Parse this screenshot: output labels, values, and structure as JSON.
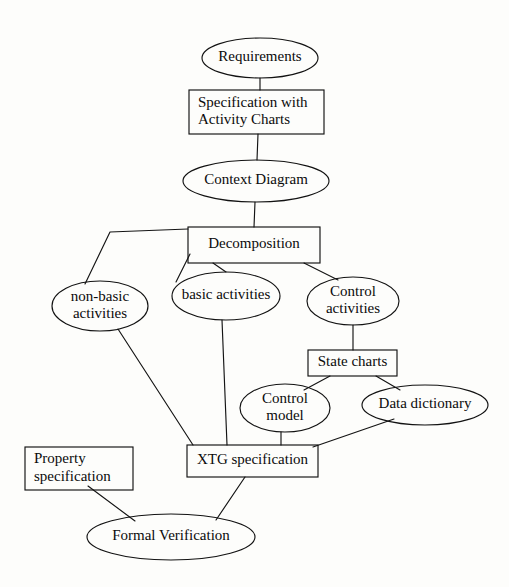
{
  "diagram": {
    "type": "flow-diagram",
    "background_color": "#fdfdfb",
    "line_color": "#141414",
    "text_color": "#0b0b0b",
    "nodes": [
      {
        "id": "requirements",
        "label": "Requirements",
        "shape": "ellipse",
        "lines": [
          "Requirements"
        ],
        "cx": 260,
        "cy": 58,
        "rx": 58,
        "ry": 20
      },
      {
        "id": "specification-with-activity-charts",
        "label": "Specification with Activity Charts",
        "shape": "rectangle",
        "lines": [
          "Specification with",
          "Activity Charts"
        ],
        "x": 189,
        "y": 90,
        "w": 135,
        "h": 44
      },
      {
        "id": "context-diagram",
        "label": "Context Diagram",
        "shape": "ellipse",
        "lines": [
          "Context Diagram"
        ],
        "cx": 256,
        "cy": 181,
        "rx": 73,
        "ry": 21
      },
      {
        "id": "decomposition",
        "label": "Decomposition",
        "shape": "rectangle",
        "lines": [
          "Decomposition"
        ],
        "x": 188,
        "y": 227,
        "w": 132,
        "h": 36
      },
      {
        "id": "non-basic-activities",
        "label": "non-basic activities",
        "shape": "ellipse",
        "lines": [
          "non-basic",
          "activities"
        ],
        "cx": 100,
        "cy": 306,
        "rx": 48,
        "ry": 25
      },
      {
        "id": "basic-activities",
        "label": "basic activities",
        "shape": "ellipse",
        "lines": [
          "basic activities"
        ],
        "cx": 226,
        "cy": 296,
        "rx": 54,
        "ry": 24
      },
      {
        "id": "control-activities",
        "label": "Control activities",
        "shape": "ellipse",
        "lines": [
          "Control",
          "activities"
        ],
        "cx": 353,
        "cy": 301,
        "rx": 46,
        "ry": 24
      },
      {
        "id": "state-charts",
        "label": "State charts",
        "shape": "rectangle",
        "lines": [
          "State charts"
        ],
        "x": 308,
        "y": 350,
        "w": 89,
        "h": 26
      },
      {
        "id": "control-model",
        "label": "Control model",
        "shape": "ellipse",
        "lines": [
          "Control",
          "model"
        ],
        "cx": 285,
        "cy": 408,
        "rx": 45,
        "ry": 24
      },
      {
        "id": "data-dictionary",
        "label": "Data dictionary",
        "shape": "ellipse",
        "lines": [
          "Data dictionary"
        ],
        "cx": 425,
        "cy": 405,
        "rx": 63,
        "ry": 20
      },
      {
        "id": "xtg-specification",
        "label": "XTG specification",
        "shape": "rectangle",
        "lines": [
          "XTG specification"
        ],
        "x": 187,
        "y": 445,
        "w": 131,
        "h": 32
      },
      {
        "id": "property-specification",
        "label": "Property specification",
        "shape": "rectangle",
        "lines": [
          "Property",
          "specification"
        ],
        "x": 25,
        "y": 447,
        "w": 108,
        "h": 43
      },
      {
        "id": "formal-verification",
        "label": "Formal Verification",
        "shape": "ellipse",
        "lines": [
          "Formal Verification"
        ],
        "cx": 171,
        "cy": 537,
        "rx": 84,
        "ry": 23
      }
    ],
    "edges": [
      {
        "id": "requirements-to-specification",
        "from": "requirements",
        "to": "specification-with-activity-charts",
        "points": "260,78 260,90"
      },
      {
        "id": "specification-to-context-diagram",
        "from": "specification-with-activity-charts",
        "to": "context-diagram",
        "points": "258,134 257,160"
      },
      {
        "id": "context-diagram-to-decomposition",
        "from": "context-diagram",
        "to": "decomposition",
        "points": "255,202 254,227"
      },
      {
        "id": "decomposition-to-non-basic-activities",
        "from": "decomposition",
        "to": "non-basic-activities",
        "points": "188,229 110,232 85,284"
      },
      {
        "id": "decomposition-to-basic-activities",
        "from": "decomposition",
        "to": "basic-activities",
        "points": "190,254 176,282"
      },
      {
        "id": "decomposition-to-basic-activities-b",
        "from": "decomposition",
        "to": "basic-activities",
        "points": "213,263 226,272"
      },
      {
        "id": "decomposition-to-control-activities",
        "from": "decomposition",
        "to": "control-activities",
        "points": "304,263 338,280"
      },
      {
        "id": "control-activities-to-state-charts",
        "from": "control-activities",
        "to": "state-charts",
        "points": "353,325 353,350"
      },
      {
        "id": "state-charts-to-control-model",
        "from": "state-charts",
        "to": "control-model",
        "points": "330,376 304,390"
      },
      {
        "id": "state-charts-to-data-dictionary",
        "from": "state-charts",
        "to": "data-dictionary",
        "points": "376,376 400,390"
      },
      {
        "id": "non-basic-activities-to-xtg-specification",
        "from": "non-basic-activities",
        "to": "xtg-specification",
        "points": "118,329 193,445"
      },
      {
        "id": "basic-activities-to-xtg-specification",
        "from": "basic-activities",
        "to": "xtg-specification",
        "points": "222,320 227,445"
      },
      {
        "id": "control-model-to-xtg-specification",
        "from": "control-model",
        "to": "xtg-specification",
        "points": "281,432 281,445"
      },
      {
        "id": "data-dictionary-to-xtg-specification",
        "from": "data-dictionary",
        "to": "xtg-specification",
        "points": "394,419 313,447"
      },
      {
        "id": "property-specification-to-formal-verification",
        "from": "property-specification",
        "to": "formal-verification",
        "points": "88,486 135,521"
      },
      {
        "id": "xtg-specification-to-formal-verification",
        "from": "xtg-specification",
        "to": "formal-verification",
        "points": "245,477 216,520"
      }
    ]
  }
}
